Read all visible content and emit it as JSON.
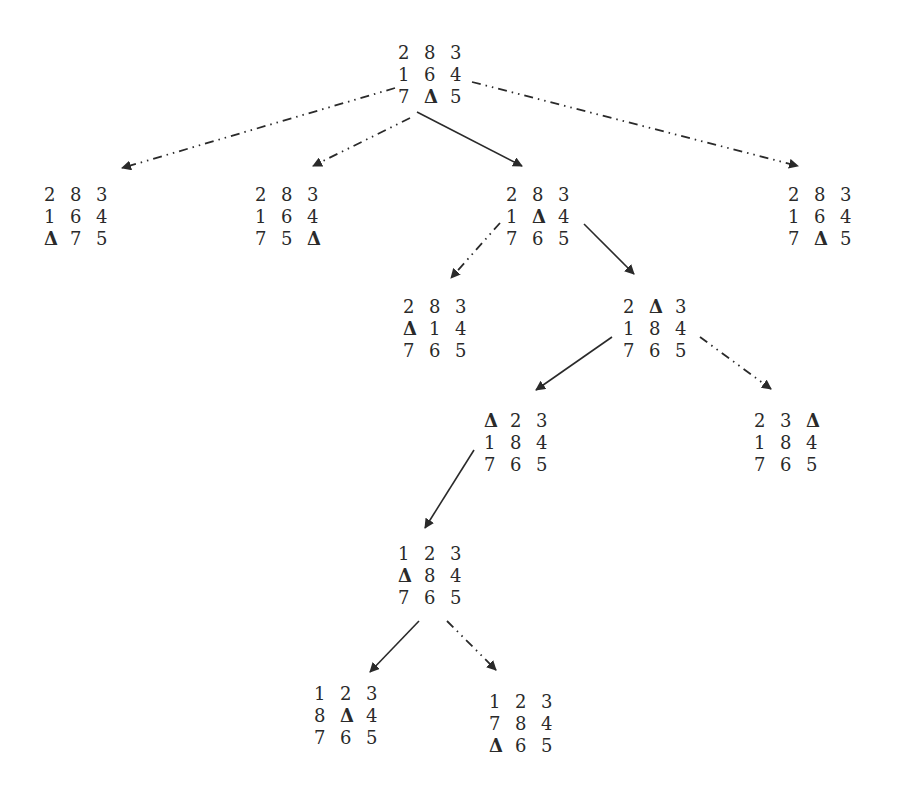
{
  "diagram": {
    "title": "",
    "blank_symbol": "Δ",
    "colors": {
      "text": "#2a2a2a",
      "edge": "#2a2a2a",
      "background": "#ffffff"
    },
    "legend": {
      "solid": "solution path",
      "dashdot": "alternative expansion"
    }
  },
  "nodes": [
    {
      "id": "root",
      "x": 398,
      "y": 42,
      "grid": [
        [
          "2",
          "8",
          "3"
        ],
        [
          "1",
          "6",
          "4"
        ],
        [
          "7",
          "Δ",
          "5"
        ]
      ]
    },
    {
      "id": "l1a",
      "x": 44,
      "y": 184,
      "grid": [
        [
          "2",
          "8",
          "3"
        ],
        [
          "1",
          "6",
          "4"
        ],
        [
          "Δ",
          "7",
          "5"
        ]
      ]
    },
    {
      "id": "l1b",
      "x": 255,
      "y": 184,
      "grid": [
        [
          "2",
          "8",
          "3"
        ],
        [
          "1",
          "6",
          "4"
        ],
        [
          "7",
          "5",
          "Δ"
        ]
      ]
    },
    {
      "id": "l1c",
      "x": 506,
      "y": 184,
      "grid": [
        [
          "2",
          "8",
          "3"
        ],
        [
          "1",
          "Δ",
          "4"
        ],
        [
          "7",
          "6",
          "5"
        ]
      ]
    },
    {
      "id": "l1d",
      "x": 788,
      "y": 184,
      "grid": [
        [
          "2",
          "8",
          "3"
        ],
        [
          "1",
          "6",
          "4"
        ],
        [
          "7",
          "Δ",
          "5"
        ]
      ]
    },
    {
      "id": "l2a",
      "x": 403,
      "y": 296,
      "grid": [
        [
          "2",
          "8",
          "3"
        ],
        [
          "Δ",
          "1",
          "4"
        ],
        [
          "7",
          "6",
          "5"
        ]
      ]
    },
    {
      "id": "l2b",
      "x": 623,
      "y": 296,
      "grid": [
        [
          "2",
          "Δ",
          "3"
        ],
        [
          "1",
          "8",
          "4"
        ],
        [
          "7",
          "6",
          "5"
        ]
      ]
    },
    {
      "id": "l3a",
      "x": 484,
      "y": 410,
      "grid": [
        [
          "Δ",
          "2",
          "3"
        ],
        [
          "1",
          "8",
          "4"
        ],
        [
          "7",
          "6",
          "5"
        ]
      ]
    },
    {
      "id": "l3b",
      "x": 754,
      "y": 410,
      "grid": [
        [
          "2",
          "3",
          "Δ"
        ],
        [
          "1",
          "8",
          "4"
        ],
        [
          "7",
          "6",
          "5"
        ]
      ]
    },
    {
      "id": "l4a",
      "x": 398,
      "y": 543,
      "grid": [
        [
          "1",
          "2",
          "3"
        ],
        [
          "Δ",
          "8",
          "4"
        ],
        [
          "7",
          "6",
          "5"
        ]
      ]
    },
    {
      "id": "l5a",
      "x": 314,
      "y": 683,
      "grid": [
        [
          "1",
          "2",
          "3"
        ],
        [
          "8",
          "Δ",
          "4"
        ],
        [
          "7",
          "6",
          "5"
        ]
      ]
    },
    {
      "id": "l5b",
      "x": 489,
      "y": 691,
      "grid": [
        [
          "1",
          "2",
          "3"
        ],
        [
          "7",
          "8",
          "4"
        ],
        [
          "Δ",
          "6",
          "5"
        ]
      ]
    }
  ],
  "edges": [
    {
      "from": "root",
      "to": "l1a",
      "style": "dashdot",
      "x1": 395,
      "y1": 88,
      "x2": 122,
      "y2": 168
    },
    {
      "from": "root",
      "to": "l1b",
      "style": "dashdot",
      "x1": 410,
      "y1": 118,
      "x2": 313,
      "y2": 166
    },
    {
      "from": "root",
      "to": "l1c",
      "style": "solid",
      "x1": 417,
      "y1": 112,
      "x2": 522,
      "y2": 166
    },
    {
      "from": "root",
      "to": "l1d",
      "style": "dashdot",
      "x1": 472,
      "y1": 82,
      "x2": 798,
      "y2": 166
    },
    {
      "from": "l1c",
      "to": "l2a",
      "style": "dashdot",
      "x1": 500,
      "y1": 223,
      "x2": 451,
      "y2": 278
    },
    {
      "from": "l1c",
      "to": "l2b",
      "style": "solid",
      "x1": 584,
      "y1": 224,
      "x2": 634,
      "y2": 274
    },
    {
      "from": "l2b",
      "to": "l3a",
      "style": "solid",
      "x1": 612,
      "y1": 337,
      "x2": 536,
      "y2": 390
    },
    {
      "from": "l2b",
      "to": "l3b",
      "style": "dashdot",
      "x1": 700,
      "y1": 337,
      "x2": 771,
      "y2": 389
    },
    {
      "from": "l3a",
      "to": "l4a",
      "style": "solid",
      "x1": 474,
      "y1": 450,
      "x2": 425,
      "y2": 528
    },
    {
      "from": "l4a",
      "to": "l5a",
      "style": "solid",
      "x1": 419,
      "y1": 621,
      "x2": 370,
      "y2": 672
    },
    {
      "from": "l4a",
      "to": "l5b",
      "style": "dashdot",
      "x1": 447,
      "y1": 621,
      "x2": 496,
      "y2": 670
    }
  ]
}
